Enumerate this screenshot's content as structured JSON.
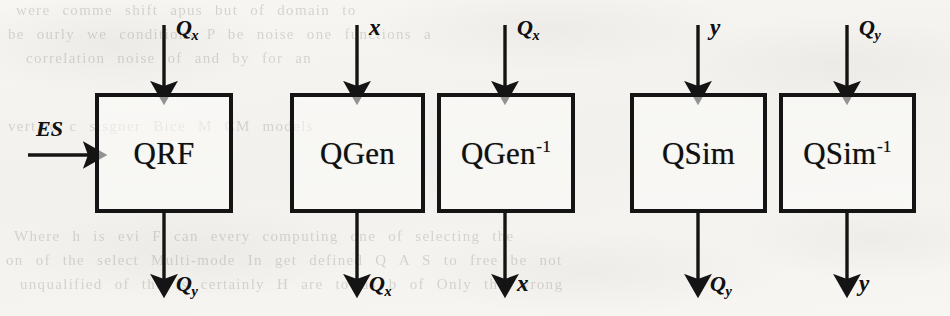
{
  "figure": {
    "background_color": "#f7f6f3",
    "ink_color": "#141414",
    "blocks": [
      {
        "id": "qrf",
        "label": "QRF",
        "has_superscript": false,
        "superscript": "",
        "x": 95,
        "y": 93,
        "width": 138,
        "height": 120
      },
      {
        "id": "qgen",
        "label": "QGen",
        "has_superscript": false,
        "superscript": "",
        "x": 290,
        "y": 93,
        "width": 135,
        "height": 120
      },
      {
        "id": "qgen-inverse",
        "label": "QGen",
        "has_superscript": true,
        "superscript": "-1",
        "x": 437,
        "y": 93,
        "width": 138,
        "height": 120
      },
      {
        "id": "qsim",
        "label": "QSim",
        "has_superscript": false,
        "superscript": "",
        "x": 630,
        "y": 93,
        "width": 137,
        "height": 120
      },
      {
        "id": "qsim-inverse",
        "label": "QSim",
        "has_superscript": true,
        "superscript": "-1",
        "x": 779,
        "y": 93,
        "width": 137,
        "height": 120
      }
    ],
    "signals": [
      {
        "id": "qrf-in-top",
        "base": "Q",
        "subscript": "x",
        "direction": "down",
        "block": "qrf"
      },
      {
        "id": "qrf-in-left",
        "base": "ES",
        "subscript": "",
        "direction": "right",
        "block": "qrf"
      },
      {
        "id": "qrf-out",
        "base": "Q",
        "subscript": "y",
        "direction": "down",
        "block": "qrf"
      },
      {
        "id": "qgen-in",
        "base": "x",
        "subscript": "",
        "direction": "down",
        "block": "qgen"
      },
      {
        "id": "qgen-out",
        "base": "Q",
        "subscript": "x",
        "direction": "down",
        "block": "qgen"
      },
      {
        "id": "qgen-inv-in",
        "base": "Q",
        "subscript": "x",
        "direction": "down",
        "block": "qgen-inverse"
      },
      {
        "id": "qgen-inv-out",
        "base": "x",
        "subscript": "",
        "direction": "down",
        "block": "qgen-inverse"
      },
      {
        "id": "qsim-in",
        "base": "y",
        "subscript": "",
        "direction": "down",
        "block": "qsim"
      },
      {
        "id": "qsim-out",
        "base": "Q",
        "subscript": "y",
        "direction": "down",
        "block": "qsim"
      },
      {
        "id": "qsim-inv-in",
        "base": "Q",
        "subscript": "y",
        "direction": "down",
        "block": "qsim-inverse"
      },
      {
        "id": "qsim-inv-out",
        "base": "y",
        "subscript": "",
        "direction": "down",
        "block": "qsim-inverse"
      }
    ],
    "labels": {
      "qrf_block": "QRF",
      "qgen_block": "QGen",
      "qgen_inverse_block": "QGen",
      "qsim_block": "QSim",
      "qsim_inverse_block": "QSim",
      "inverse_exponent": "-1",
      "es_input": "ES",
      "q_symbol": "Q",
      "sub_x": "x",
      "sub_y": "y",
      "var_x": "x",
      "var_y": "y"
    },
    "bleed_through_text": {
      "line1": "were comme     shift  apus  but  of  domain  to",
      "line2": "be   ourly  we conditions   P  be noise  one functions  a",
      "line3": "correlation  noise  of and by  for  an",
      "line4": "vert,ec   c sisgner  Bice  M CM  models",
      "line5": "Where h is evi  F can every computing  one  of selecting  the",
      "line6": "on  of the  select Multi-mode  In  get  defined  Q  A  S  to  free  be not",
      "line7": "unqualified  of the  is  certainly  H  are  to  as  b   of  Only  the  wrong"
    }
  }
}
